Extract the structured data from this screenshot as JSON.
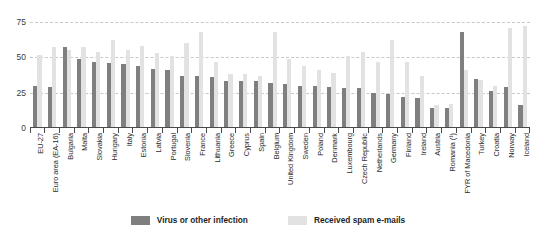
{
  "chart_data": {
    "type": "bar",
    "title": "",
    "subtitle": "",
    "xlabel": "",
    "ylabel": "",
    "ylim": [
      0,
      75
    ],
    "yticks": [
      0,
      25,
      50,
      75
    ],
    "grid": true,
    "legend_position": "bottom-center",
    "categories": [
      "EU-27",
      "Euro area (EA-16)",
      "Bulgaria",
      "Malta",
      "Slovakia",
      "Hungary",
      "Italy",
      "Estonia",
      "Latvia",
      "Portugal",
      "Slovenia",
      "France",
      "Lithuania",
      "Greece",
      "Cyprus",
      "Spain",
      "Belgium",
      "United Kingdom",
      "Sweden",
      "Poland",
      "Denmark",
      "Luxembourg",
      "Czech Republic",
      "Netherlands",
      "Germany",
      "Finland",
      "Ireland",
      "Austria",
      "Romania (¹)",
      "FYR of Macedonia",
      "Turkey",
      "Croatia",
      "Norway",
      "Iceland"
    ],
    "series": [
      {
        "name": "Virus or other infection",
        "color": "#7f7f7f",
        "values": [
          30,
          29,
          57,
          49,
          47,
          46,
          45,
          44,
          42,
          41,
          37,
          37,
          36,
          33,
          33,
          33,
          32,
          31,
          30,
          30,
          29,
          28,
          28,
          25,
          24,
          22,
          21,
          14,
          14,
          68,
          35,
          26,
          29,
          16
        ]
      },
      {
        "name": "Received spam e-mails",
        "color": "#e2e2e2",
        "values": [
          52,
          57,
          55,
          57,
          54,
          62,
          55,
          58,
          53,
          51,
          60,
          68,
          47,
          38,
          38,
          37,
          68,
          49,
          44,
          41,
          39,
          51,
          54,
          47,
          62,
          47,
          37,
          16,
          17,
          41,
          34,
          30,
          71,
          72
        ]
      }
    ]
  },
  "legend": {
    "items": [
      {
        "label": "Virus or other infection",
        "swatch": "dark"
      },
      {
        "label": "Received spam e-mails",
        "swatch": "light"
      }
    ]
  },
  "axis": {
    "y_tick_labels": [
      "75",
      "50",
      "25",
      "0"
    ]
  }
}
